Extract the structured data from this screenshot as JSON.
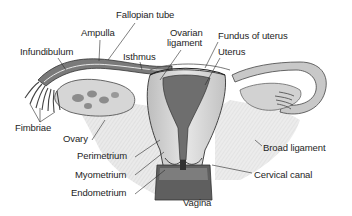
{
  "diagram": {
    "labels": [
      {
        "id": "fallopian-tube",
        "text": "Fallopian tube",
        "x": 116,
        "y": 10
      },
      {
        "id": "ampulla",
        "text": "Ampulla",
        "x": 81,
        "y": 28
      },
      {
        "id": "ovarian-ligament-line1",
        "text": "Ovarian",
        "x": 170,
        "y": 28
      },
      {
        "id": "ovarian-ligament-line2",
        "text": "ligament",
        "x": 167,
        "y": 38
      },
      {
        "id": "fundus-of-uterus",
        "text": "Fundus of uterus",
        "x": 218,
        "y": 31
      },
      {
        "id": "infundibulum",
        "text": "Infundibulum",
        "x": 20,
        "y": 47
      },
      {
        "id": "isthmus",
        "text": "Isthmus",
        "x": 123,
        "y": 52
      },
      {
        "id": "uterus",
        "text": "Uterus",
        "x": 218,
        "y": 47
      },
      {
        "id": "fimbriae",
        "text": "Fimbriae",
        "x": 15,
        "y": 123
      },
      {
        "id": "ovary",
        "text": "Ovary",
        "x": 63,
        "y": 134
      },
      {
        "id": "broad-ligament",
        "text": "Broad ligament",
        "x": 263,
        "y": 143
      },
      {
        "id": "perimetrium",
        "text": "Perimetrium",
        "x": 77,
        "y": 151
      },
      {
        "id": "myometrium",
        "text": "Myometrium",
        "x": 75,
        "y": 170
      },
      {
        "id": "cervical-canal",
        "text": "Cervical canal",
        "x": 254,
        "y": 170
      },
      {
        "id": "endometrium",
        "text": "Endometrium",
        "x": 71,
        "y": 188
      },
      {
        "id": "vagina",
        "text": "Vagina",
        "x": 183,
        "y": 198
      }
    ]
  }
}
